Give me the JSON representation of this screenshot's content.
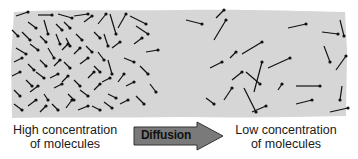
{
  "diagram": {
    "title": "Diffusion",
    "colors": {
      "background": "#ffffff",
      "panel": "#d6d6d6",
      "molecule": "#111111",
      "arrow_fill": "#7a7a7a",
      "arrow_stroke": "#333333"
    },
    "labels": {
      "left_line1": "High concentration",
      "left_line2": "of molecules",
      "arrow": "Diffusion",
      "right_line1": "Low concentration",
      "right_line2": "of molecules"
    },
    "molecules": [
      [
        16,
        16,
        28,
        12
      ],
      [
        38,
        15,
        52,
        15
      ],
      [
        58,
        14,
        72,
        18
      ],
      [
        74,
        16,
        88,
        14
      ],
      [
        28,
        22,
        36,
        28
      ],
      [
        44,
        20,
        48,
        34
      ],
      [
        56,
        24,
        62,
        30
      ],
      [
        64,
        22,
        70,
        28
      ],
      [
        84,
        22,
        92,
        16
      ],
      [
        98,
        24,
        106,
        14
      ],
      [
        110,
        14,
        116,
        34
      ],
      [
        12,
        30,
        18,
        36
      ],
      [
        22,
        32,
        30,
        40
      ],
      [
        40,
        36,
        46,
        42
      ],
      [
        56,
        34,
        60,
        44
      ],
      [
        66,
        38,
        70,
        46
      ],
      [
        76,
        34,
        82,
        40
      ],
      [
        94,
        32,
        100,
        38
      ],
      [
        104,
        34,
        108,
        46
      ],
      [
        118,
        28,
        126,
        14
      ],
      [
        130,
        16,
        146,
        24
      ],
      [
        16,
        48,
        26,
        54
      ],
      [
        30,
        44,
        38,
        50
      ],
      [
        48,
        48,
        54,
        58
      ],
      [
        62,
        50,
        68,
        44
      ],
      [
        74,
        54,
        80,
        48
      ],
      [
        86,
        46,
        92,
        52
      ],
      [
        98,
        52,
        104,
        60
      ],
      [
        112,
        48,
        120,
        42
      ],
      [
        136,
        26,
        148,
        34
      ],
      [
        134,
        44,
        142,
        38
      ],
      [
        14,
        62,
        22,
        58
      ],
      [
        28,
        64,
        34,
        70
      ],
      [
        40,
        60,
        46,
        66
      ],
      [
        54,
        66,
        60,
        60
      ],
      [
        64,
        62,
        70,
        68
      ],
      [
        80,
        64,
        88,
        58
      ],
      [
        94,
        66,
        100,
        72
      ],
      [
        108,
        60,
        112,
        74
      ],
      [
        124,
        58,
        134,
        62
      ],
      [
        146,
        52,
        158,
        50
      ],
      [
        12,
        76,
        20,
        72
      ],
      [
        26,
        80,
        32,
        86
      ],
      [
        36,
        72,
        44,
        78
      ],
      [
        50,
        78,
        58,
        74
      ],
      [
        62,
        82,
        68,
        76
      ],
      [
        74,
        80,
        80,
        86
      ],
      [
        88,
        78,
        94,
        72
      ],
      [
        102,
        82,
        110,
        78
      ],
      [
        118,
        82,
        124,
        74
      ],
      [
        140,
        66,
        148,
        74
      ],
      [
        14,
        90,
        20,
        96
      ],
      [
        30,
        92,
        38,
        86
      ],
      [
        44,
        94,
        48,
        100
      ],
      [
        54,
        88,
        62,
        84
      ],
      [
        68,
        94,
        74,
        100
      ],
      [
        80,
        90,
        88,
        96
      ],
      [
        94,
        90,
        100,
        84
      ],
      [
        108,
        94,
        116,
        98
      ],
      [
        126,
        86,
        134,
        82
      ],
      [
        150,
        84,
        156,
        92
      ],
      [
        14,
        104,
        22,
        110
      ],
      [
        28,
        106,
        36,
        100
      ],
      [
        40,
        112,
        46,
        106
      ],
      [
        52,
        104,
        58,
        110
      ],
      [
        66,
        108,
        72,
        100
      ],
      [
        78,
        110,
        88,
        106
      ],
      [
        92,
        106,
        100,
        110
      ],
      [
        104,
        102,
        112,
        108
      ],
      [
        120,
        104,
        128,
        100
      ],
      [
        136,
        96,
        144,
        104
      ],
      [
        186,
        20,
        202,
        24
      ],
      [
        216,
        18,
        224,
        10
      ],
      [
        214,
        40,
        226,
        20
      ],
      [
        242,
        54,
        262,
        42
      ],
      [
        230,
        58,
        236,
        52
      ],
      [
        210,
        68,
        222,
        62
      ],
      [
        254,
        92,
        262,
        62
      ],
      [
        232,
        80,
        242,
        72
      ],
      [
        246,
        72,
        260,
        84
      ],
      [
        268,
        68,
        290,
        58
      ],
      [
        288,
        28,
        306,
        24
      ],
      [
        322,
        32,
        338,
        34
      ],
      [
        340,
        20,
        344,
        36
      ],
      [
        324,
        46,
        330,
        62
      ],
      [
        206,
        98,
        214,
        104
      ],
      [
        224,
        100,
        232,
        88
      ],
      [
        252,
        112,
        266,
        106
      ],
      [
        244,
        88,
        256,
        112
      ],
      [
        278,
        90,
        282,
        84
      ],
      [
        296,
        86,
        320,
        86
      ],
      [
        296,
        104,
        312,
        100
      ],
      [
        336,
        70,
        346,
        56
      ],
      [
        342,
        86,
        340,
        100
      ],
      [
        330,
        112,
        348,
        108
      ]
    ]
  }
}
